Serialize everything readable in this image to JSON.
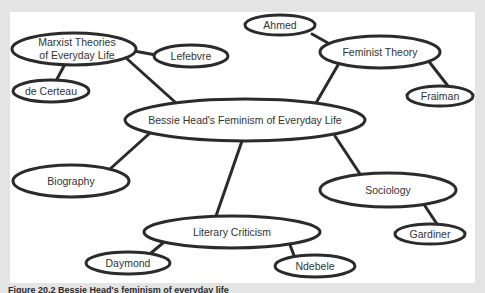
{
  "diagram": {
    "type": "concept-map",
    "colors": {
      "background": "#e4e4e4",
      "panel": "#ffffff",
      "stroke": "#2b2b2b",
      "text": "#333333"
    },
    "nodes": {
      "central": {
        "label": "Bessie Head's Feminism of Everyday Life",
        "cx": 245,
        "cy": 120,
        "rx": 120,
        "ry": 21
      },
      "marxist": {
        "label_line1": "Marxist Theories",
        "label_line2": "of Everyday Life",
        "cx": 74,
        "cy": 49,
        "rx": 62,
        "ry": 16
      },
      "lefebvre": {
        "label": "Lefebvre",
        "cx": 191,
        "cy": 56,
        "rx": 37,
        "ry": 11
      },
      "decerteau": {
        "label": "de Certeau",
        "cx": 51,
        "cy": 91,
        "rx": 38,
        "ry": 11
      },
      "ahmed": {
        "label": "Ahmed",
        "cx": 297,
        "cy": 25,
        "rx": 35,
        "ry": 10
      },
      "feminist": {
        "label": "Feminist Theory",
        "cx": 370,
        "cy": 52,
        "rx": 60,
        "ry": 16
      },
      "fraiman": {
        "label": "Fraiman",
        "cx": 437,
        "cy": 96,
        "rx": 33,
        "ry": 10
      },
      "biography": {
        "label": "Biography",
        "cx": 71,
        "cy": 181,
        "rx": 58,
        "ry": 16
      },
      "sociology": {
        "label": "Sociology",
        "cx": 369,
        "cy": 190,
        "rx": 68,
        "ry": 17
      },
      "gardiner": {
        "label": "Gardiner",
        "cx": 430,
        "cy": 234,
        "rx": 35,
        "ry": 10
      },
      "literary": {
        "label": "Literary Criticism",
        "cx": 235,
        "cy": 232,
        "rx": 90,
        "ry": 16
      },
      "daymond": {
        "label": "Daymond",
        "cx": 128,
        "cy": 263,
        "rx": 42,
        "ry": 11
      },
      "ndebele": {
        "label": "Ndebele",
        "cx": 323,
        "cy": 266,
        "rx": 40,
        "ry": 11
      }
    },
    "edges": [
      [
        "central",
        "marxist"
      ],
      [
        "marxist",
        "lefebvre"
      ],
      [
        "marxist",
        "decerteau"
      ],
      [
        "central",
        "feminist"
      ],
      [
        "feminist",
        "ahmed"
      ],
      [
        "feminist",
        "fraiman"
      ],
      [
        "central",
        "biography"
      ],
      [
        "central",
        "sociology"
      ],
      [
        "sociology",
        "gardiner"
      ],
      [
        "central",
        "literary"
      ],
      [
        "literary",
        "daymond"
      ],
      [
        "literary",
        "ndebele"
      ]
    ]
  },
  "caption": {
    "text": "Figure 20.2 Bessie Head's feminism of everyday life"
  }
}
